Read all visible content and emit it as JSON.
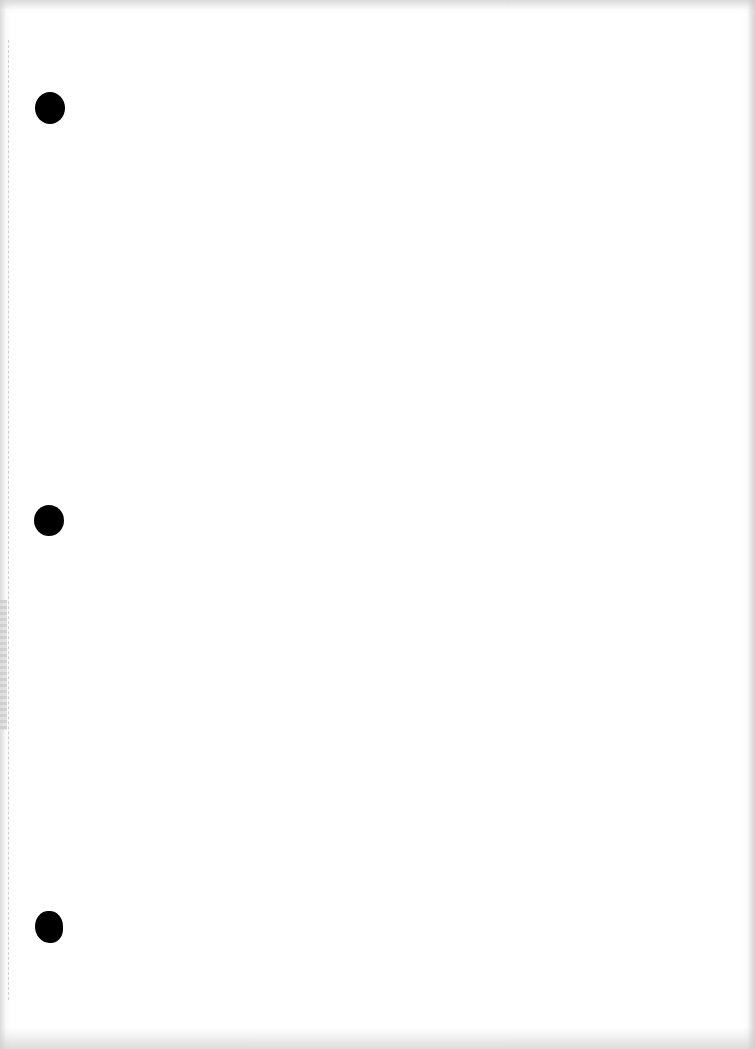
{
  "document": {
    "type": "blank scanned page",
    "text_content": "",
    "paper_color": "#ffffff",
    "punch_holes": [
      {
        "cx": 50,
        "cy": 108,
        "w": 30,
        "h": 32
      },
      {
        "cx": 49,
        "cy": 520,
        "w": 30,
        "h": 31
      },
      {
        "cx": 49,
        "cy": 927,
        "w": 28,
        "h": 32
      }
    ],
    "hole_color": "#000000"
  }
}
